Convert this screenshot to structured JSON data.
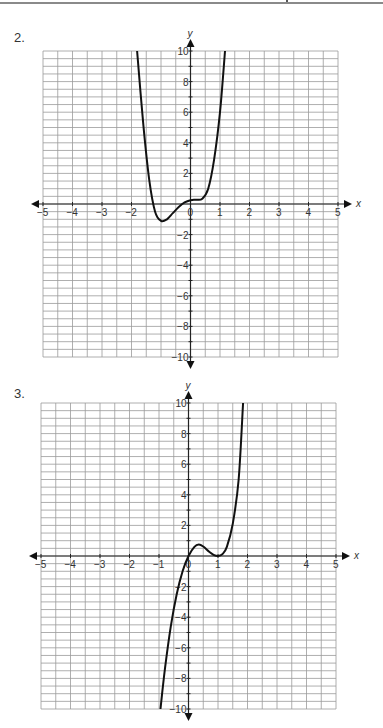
{
  "page": {
    "width": 383,
    "height": 728
  },
  "problems": [
    {
      "number_label": "2."
    },
    {
      "number_label": "3."
    }
  ],
  "chart_data": [
    {
      "type": "line",
      "title": "2.",
      "xlabel": "x",
      "ylabel": "y",
      "xlim": [
        -5,
        5
      ],
      "ylim": [
        -10,
        10
      ],
      "grid": true,
      "grid_minor_step_x": 0.5,
      "grid_minor_step_y": 0.5,
      "x_tick_labels": [
        "-5",
        "-4",
        "-3",
        "-2",
        "0",
        "1",
        "2",
        "3",
        "4",
        "5"
      ],
      "x_ticks": [
        -5,
        -4,
        -3,
        -2,
        0,
        1,
        2,
        3,
        4,
        5
      ],
      "y_tick_labels": [
        "10",
        "8",
        "6",
        "4",
        "2",
        "-2",
        "-4",
        "-6",
        "-8",
        "-10"
      ],
      "y_ticks": [
        10,
        8,
        6,
        4,
        2,
        -2,
        -4,
        -6,
        -8,
        -10
      ],
      "origin_label": "0",
      "series": [
        {
          "name": "curve",
          "description": "quartic-like curve: falls steeply from top left, minimum near (-1,-1.1), flat inflection near (0.3,0.3), rises steeply to top right",
          "x": [
            -1.81,
            -1.6,
            -1.4,
            -1.2,
            -1.0,
            -0.8,
            -0.6,
            -0.4,
            -0.2,
            0.0,
            0.2,
            0.4,
            0.6,
            0.8,
            1.0,
            1.17
          ],
          "y": [
            10,
            5.2,
            1.6,
            -0.5,
            -1.1,
            -1.0,
            -0.6,
            -0.2,
            0.1,
            0.25,
            0.28,
            0.35,
            1.0,
            2.9,
            6.0,
            10
          ]
        }
      ]
    },
    {
      "type": "line",
      "title": "3.",
      "xlabel": "x",
      "ylabel": "y",
      "xlim": [
        -5,
        5
      ],
      "ylim": [
        -10,
        10
      ],
      "grid": true,
      "grid_minor_step_x": 0.5,
      "grid_minor_step_y": 0.5,
      "x_tick_labels": [
        "-5",
        "-4",
        "-3",
        "-2",
        "-1",
        "0",
        "1",
        "2",
        "3",
        "4",
        "5"
      ],
      "x_ticks": [
        -5,
        -4,
        -3,
        -2,
        -1,
        0,
        1,
        2,
        3,
        4,
        5
      ],
      "y_tick_labels": [
        "10",
        "8",
        "6",
        "4",
        "2",
        "-2",
        "-4",
        "-6",
        "-8",
        "-10"
      ],
      "y_ticks": [
        10,
        8,
        6,
        4,
        2,
        -2,
        -4,
        -6,
        -8,
        -10
      ],
      "origin_label": "0",
      "series": [
        {
          "name": "curve",
          "description": "rises from bottom near x=-0.95, crosses origin, local max near (0.35,0.75), touches x-axis at (1,0), rises steeply to top near x=1.85",
          "x": [
            -0.95,
            -0.8,
            -0.6,
            -0.4,
            -0.2,
            0.0,
            0.2,
            0.35,
            0.5,
            0.7,
            0.85,
            1.0,
            1.15,
            1.3,
            1.5,
            1.7,
            1.85
          ],
          "y": [
            -10,
            -7.4,
            -4.6,
            -2.5,
            -1.0,
            0.0,
            0.6,
            0.75,
            0.62,
            0.28,
            0.08,
            0.0,
            0.12,
            0.6,
            2.1,
            5.0,
            10
          ]
        }
      ]
    }
  ]
}
